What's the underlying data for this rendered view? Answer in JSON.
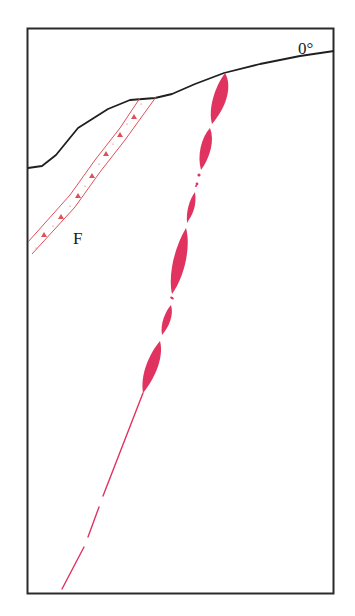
{
  "diagram": {
    "labels": {
      "fault": "F",
      "angle": "0°"
    },
    "colors": {
      "frame": "#2a2a2a",
      "surface": "#1f1f1f",
      "vein": "#e0335f",
      "fault_zone": "#e0505a"
    },
    "elements": [
      {
        "name": "frame",
        "type": "rectangle"
      },
      {
        "name": "ground-surface",
        "type": "polyline"
      },
      {
        "name": "fault-zone-F",
        "type": "band with dot markers"
      },
      {
        "name": "vein",
        "type": "lenticular segments + thin tail line"
      }
    ]
  }
}
